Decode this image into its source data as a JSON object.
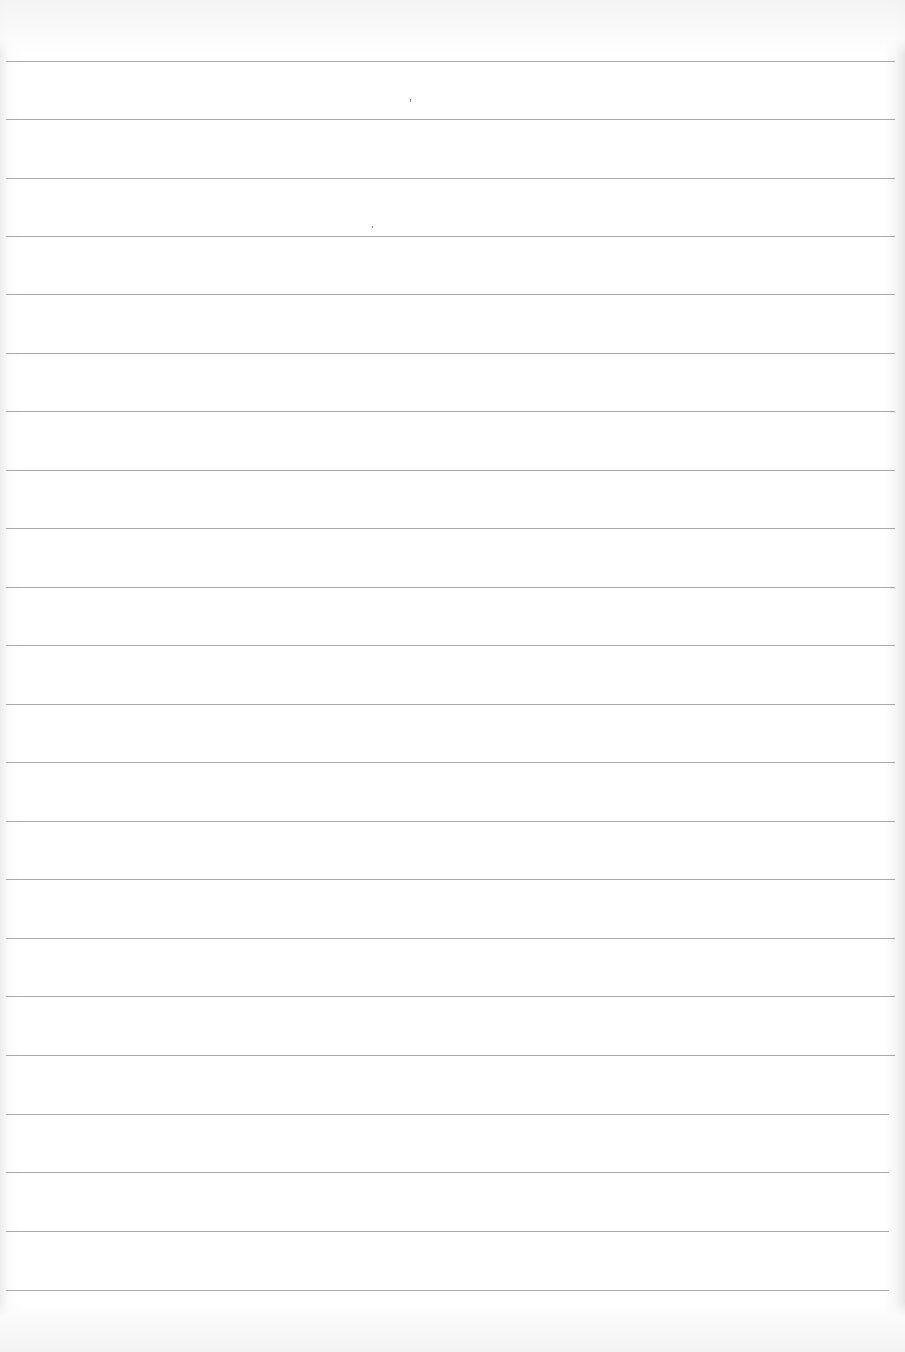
{
  "page": {
    "type": "blank ruled paper",
    "background_color": "#ffffff",
    "line_color": "#9a9a9a",
    "line_count": 22,
    "line_left_px": 6,
    "line_right_px": 895,
    "line_y_positions": [
      61,
      119,
      178,
      236,
      294,
      353,
      411,
      470,
      528,
      587,
      645,
      704,
      762,
      821,
      879,
      938,
      996,
      1055,
      1114,
      1172,
      1231,
      1290
    ],
    "text_content": ""
  }
}
